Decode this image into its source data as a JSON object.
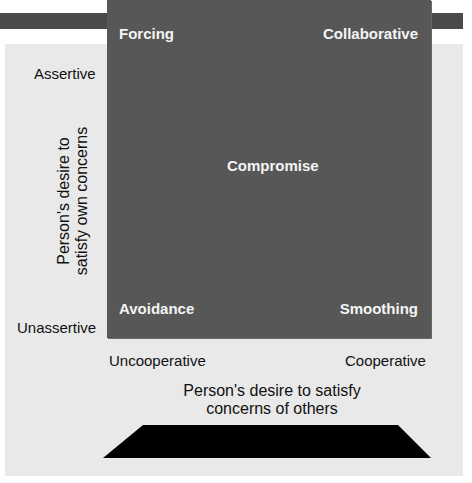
{
  "diagram": {
    "quadrants": {
      "top_left": "Forcing",
      "top_right": "Collaborative",
      "center": "Compromise",
      "bottom_left": "Avoidance",
      "bottom_right": "Smoothing"
    },
    "y_axis": {
      "high_label": "Assertive",
      "low_label": "Unassertive",
      "title_line1": "Person's desire to",
      "title_line2": "satisfy own concerns"
    },
    "x_axis": {
      "low_label": "Uncooperative",
      "high_label": "Cooperative",
      "title_line1": "Person's desire to satisfy",
      "title_line2": "concerns of others"
    },
    "colors": {
      "square": "#575757",
      "panel": "#e9e9e9",
      "top_bar": "#4a4a4a",
      "base": "#000000",
      "quadrant_text": "#f4f4f4"
    }
  }
}
